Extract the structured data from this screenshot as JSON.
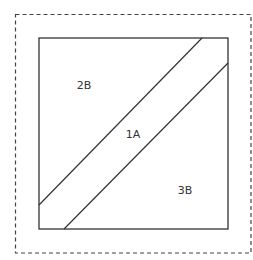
{
  "diagram": {
    "type": "quilt-block-pattern",
    "colors": {
      "line": "#333333",
      "dashed": "#444444",
      "background": "#ffffff"
    },
    "seam_allowance_border": {
      "style": "dashed",
      "x": 15,
      "y": 14,
      "width": 236,
      "height": 239
    },
    "block": {
      "x": 39,
      "y": 38,
      "width": 189,
      "height": 191
    },
    "strip_lines": [
      {
        "x1": 39,
        "y1": 205,
        "x2": 202,
        "y2": 38
      },
      {
        "x1": 64,
        "y1": 229,
        "x2": 228,
        "y2": 63
      }
    ],
    "pieces": [
      {
        "label": "2B",
        "x": 84,
        "y": 89
      },
      {
        "label": "1A",
        "x": 133,
        "y": 138
      },
      {
        "label": "3B",
        "x": 185,
        "y": 194
      }
    ]
  }
}
